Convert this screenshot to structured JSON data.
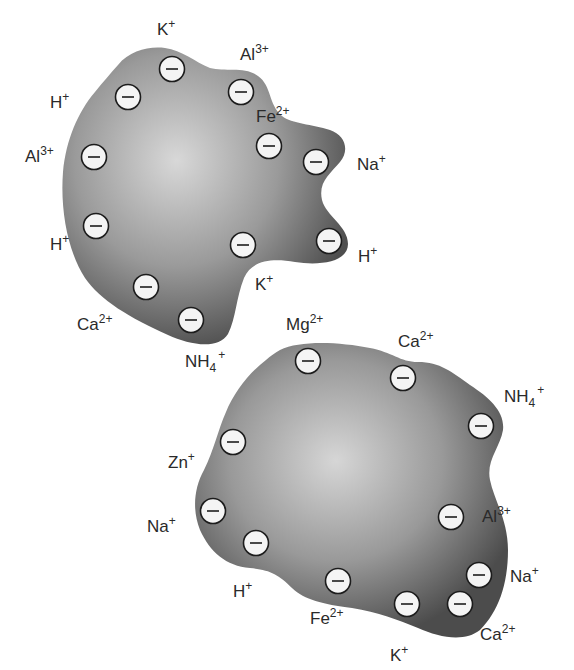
{
  "colors": {
    "particle_edge": "#4a4a4a",
    "particle_center": "#d6d6d6",
    "charge_fill": "#f4f4f4",
    "text": "#2a2a2a"
  },
  "charge_symbol": "−",
  "particles": [
    {
      "name": "upper-particle",
      "charge_count": 12,
      "cations": [
        {
          "base": "K",
          "sup": "+",
          "sub": ""
        },
        {
          "base": "Al",
          "sup": "3+",
          "sub": ""
        },
        {
          "base": "H",
          "sup": "+",
          "sub": ""
        },
        {
          "base": "Fe",
          "sup": "2+",
          "sub": ""
        },
        {
          "base": "Al",
          "sup": "3+",
          "sub": ""
        },
        {
          "base": "Na",
          "sup": "+",
          "sub": ""
        },
        {
          "base": "H",
          "sup": "+",
          "sub": ""
        },
        {
          "base": "H",
          "sup": "+",
          "sub": ""
        },
        {
          "base": "K",
          "sup": "+",
          "sub": ""
        },
        {
          "base": "Ca",
          "sup": "2+",
          "sub": ""
        },
        {
          "base": "NH",
          "sup": "+",
          "sub": "4"
        }
      ]
    },
    {
      "name": "lower-particle",
      "charge_count": 11,
      "cations": [
        {
          "base": "Mg",
          "sup": "2+",
          "sub": ""
        },
        {
          "base": "Ca",
          "sup": "2+",
          "sub": ""
        },
        {
          "base": "NH",
          "sup": "+",
          "sub": "4"
        },
        {
          "base": "Zn",
          "sup": "+",
          "sub": ""
        },
        {
          "base": "Al",
          "sup": "3+",
          "sub": ""
        },
        {
          "base": "Na",
          "sup": "+",
          "sub": ""
        },
        {
          "base": "Na",
          "sup": "+",
          "sub": ""
        },
        {
          "base": "H",
          "sup": "+",
          "sub": ""
        },
        {
          "base": "Fe",
          "sup": "2+",
          "sub": ""
        },
        {
          "base": "Ca",
          "sup": "2+",
          "sub": ""
        },
        {
          "base": "K",
          "sup": "+",
          "sub": ""
        }
      ]
    }
  ]
}
